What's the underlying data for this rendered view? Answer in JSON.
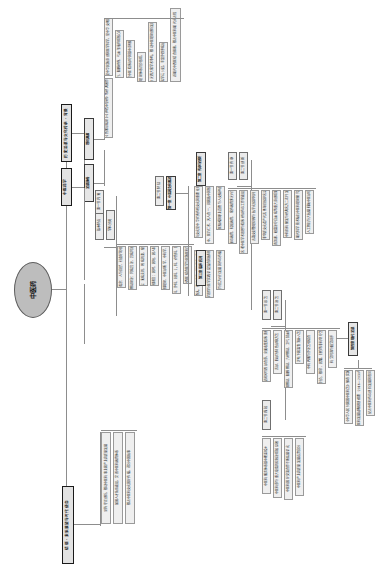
{
  "diagram": {
    "orientation": "rotated-90-ccw",
    "root": "中医药",
    "colors": {
      "root_fill": "#bdbdbd",
      "node_fill": "#ececec",
      "leaf_fill": "#efefef",
      "border": "#8a8a8a",
      "level1_border": "#1a1a1a",
      "line": "#8d8d8d",
      "text": "#1d1d1d",
      "background": "#ffffff"
    },
    "branches": [
      {
        "id": "b1",
        "label": "历史沿革与文化传承 · 背景",
        "children": [
          {
            "label": "理论渊源",
            "leaves": [
              "中医药学是中华民族原创的医学科学，是中华文明的杰出代表",
              "《黄帝内经》《伤寒杂病论》《神农本草经》等经典著作奠定理论基础",
              "阴阳五行、脏腑经络、气血津液构成核心理论体系",
              "辨证论治是中医临床诊疗的基本原则和特色优势"
            ]
          },
          {
            "label": "发展脉络",
            "leaves": [
              "先秦两汉时期理论体系初步形成，确立整体观念",
              "金元四大家学术争鸣，推动中医理论创新发展",
              "明清温病学说兴起，丰富外感热病诊治体系",
              "近现代中西医结合探索，推进中医药现代化进程"
            ]
          }
        ]
      },
      {
        "id": "b2",
        "label": "中医药学",
        "children": [
          {
            "label": "基本特点",
            "leaves": [
              "整体观念：人与自然、社会环境相统一",
              "辨证论治：同病异治、异病同治",
              "治未病：未病先防、既病防变、瘥后防复",
              "三因制宜：因时、因地、因人制宜"
            ]
          },
          {
            "label": "学科分类",
            "leaves": [
              "中医基础理论、中医诊断学、中药学、方剂学",
              "中医内科、外科、妇科、儿科、骨伤科、针灸推拿",
              "中西医结合医学与民族医药学"
            ]
          }
        ]
      },
      {
        "id": "b3",
        "label": "第一章 中医药文化概述",
        "children": [
          {
            "label": "第一节 内涵",
            "leaves": [
              "中医药文化是中华优秀传统文化的重要组成部分",
              "以人为本、医乃仁术、天人合一、调和致中的核心价值",
              "大医精诚的职业道德与人文精神追求"
            ]
          },
          {
            "label": "第二节 特征",
            "leaves": [
              "历史悠久、传承有序、理论完备、疗效确切",
              "哲学思维与医学实践深度融合的独特形态",
              "民间与官方并行发展的传承传播模式"
            ]
          }
        ]
      },
      {
        "id": "b4",
        "label": "第二章 传承与创新",
        "children": [
          {
            "label": "第一节 传承",
            "leaves": [
              "师承教育、院校教育、家传教育多元并举",
              "名老中医学术思想与临床经验传承工作室建设",
              "古籍文献整理挖掘与数字化保护利用",
              "非物质文化遗产代表性项目保护名录"
            ]
          },
          {
            "label": "第二节 创新",
            "leaves": [
              "青蒿素、砒霜治疗白血病等重大原创成果",
              "中药新药研发与经典名方二次开发",
              "现代科学技术赋能中医药理论研究",
              "人工智能与大数据辅助中医诊疗"
            ]
          }
        ]
      },
      {
        "id": "b5",
        "label": "第三章 临床应用",
        "children": [
          {
            "label": "第一节 诊法",
            "leaves": [
              "望闻问切四诊合参，全面收集临床资料",
              "舌诊、脉诊为特色诊察方法",
              "八纲辨证、脏腑辨证、六经辨证、卫气营血辨证"
            ]
          },
          {
            "label": "第二节 治法",
            "leaves": [
              "汗吐下和温清消补八法",
              "中药内服与外治法相结合",
              "针灸、推拿、拔罐、刮痧等非药物疗法",
              "药食同源与膳食调养"
            ]
          }
        ]
      },
      {
        "id": "b6",
        "label": "第四章 现代发展",
        "children": [
          {
            "label": "第一节 政策",
            "leaves": [
              "《中华人民共和国中医药法》颁布实施",
              "《中医药发展战略规划纲要（2016—2030年）》",
              "促进中医药传承创新发展的意见"
            ]
          },
          {
            "label": "第二节 成效",
            "leaves": [
              "中医药服务体系基本覆盖城乡",
              "中医药参与重大疫情防控救治成效显著",
              "中医药国际交流合作不断拓展深化",
              "中医药产业高质量发展态势良好"
            ]
          }
        ]
      },
      {
        "id": "b7",
        "label": "结语 · 未来展望与时代使命",
        "leaves": [
          "坚持守正创新，推动中医药事业和产业高质量发展",
          "加强人才队伍建设，完善中医药教育体系",
          "推进中医药文化国际传播，讲好中国故事"
        ]
      }
    ]
  }
}
